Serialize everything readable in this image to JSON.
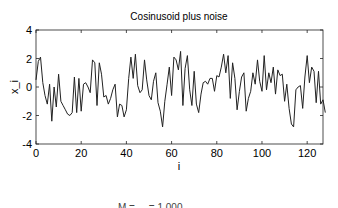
{
  "chart_data": {
    "type": "line",
    "title": "Cosinusoid plus noise",
    "xlabel": "i",
    "ylabel": "x_i",
    "xlim": [
      0,
      127
    ],
    "ylim": [
      -4,
      4
    ],
    "xticks": [
      0,
      20,
      40,
      60,
      80,
      100,
      120
    ],
    "yticks": [
      -4,
      -2,
      0,
      2,
      4
    ],
    "grid": false,
    "legend": null,
    "series": [
      {
        "name": "x_i",
        "x_start": 0,
        "values": [
          0.5,
          1.8,
          2.1,
          0.3,
          -0.6,
          -1.2,
          0.2,
          -2.4,
          0.0,
          -1.4,
          0.9,
          -1.0,
          -1.3,
          -1.6,
          -1.9,
          -2.0,
          -1.8,
          0.7,
          -1.8,
          0.6,
          -1.7,
          0.2,
          0.3,
          0.0,
          -0.4,
          1.9,
          1.7,
          -1.3,
          1.7,
          0.9,
          -0.7,
          -0.6,
          -1.2,
          -0.8,
          -0.2,
          0.2,
          -2.1,
          -1.2,
          -1.3,
          -2.1,
          -1.6,
          0.6,
          2.1,
          0.6,
          2.3,
          0.1,
          -0.4,
          -0.2,
          1.9,
          0.5,
          -0.6,
          -0.9,
          0.4,
          1.0,
          -1.1,
          -1.7,
          -2.8,
          -1.0,
          0.2,
          1.4,
          -0.6,
          2.1,
          1.9,
          1.2,
          2.5,
          -1.3,
          1.3,
          2.2,
          -0.2,
          -1.3,
          1.1,
          -1.2,
          -1.8,
          -0.5,
          0.3,
          0.4,
          0.2,
          0.6,
          0.6,
          -0.3,
          0.8,
          0.7,
          1.4,
          2.3,
          1.0,
          2.2,
          -0.8,
          1.7,
          0.6,
          -1.6,
          -0.3,
          0.7,
          1.0,
          -1.7,
          -0.8,
          -0.3,
          1.0,
          0.2,
          1.9,
          0.4,
          -0.3,
          2.2,
          -0.2,
          1.0,
          0.3,
          1.4,
          -0.5,
          1.2,
          0.8,
          0.9,
          -1.0,
          0.2,
          -1.5,
          -2.6,
          -2.8,
          -0.2,
          0.0,
          0.1,
          -1.5,
          0.7,
          2.2,
          0.3,
          1.4,
          1.1,
          -1.1,
          1.1,
          -1.2,
          -0.9,
          -1.8
        ]
      }
    ]
  },
  "footer": {
    "cut_text": "M = ... = 1.000"
  }
}
